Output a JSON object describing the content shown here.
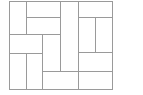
{
  "diagram": {
    "title": "",
    "line_color": "#9a9a9a",
    "background": "#ffffff",
    "frame": {
      "x": 9,
      "y": 1,
      "w": 104,
      "h": 89
    },
    "rects": [
      {
        "id": "r1",
        "x": 9,
        "y": 1,
        "w": 18,
        "h": 34
      },
      {
        "id": "r2",
        "x": 26,
        "y": 1,
        "w": 35,
        "h": 17
      },
      {
        "id": "r3",
        "x": 26,
        "y": 17,
        "w": 35,
        "h": 18
      },
      {
        "id": "r4",
        "x": 60,
        "y": 1,
        "w": 19,
        "h": 71
      },
      {
        "id": "r5",
        "x": 78,
        "y": 1,
        "w": 35,
        "h": 17
      },
      {
        "id": "r6",
        "x": 78,
        "y": 17,
        "w": 18,
        "h": 36
      },
      {
        "id": "r7",
        "x": 95,
        "y": 17,
        "w": 18,
        "h": 36
      },
      {
        "id": "r8",
        "x": 9,
        "y": 34,
        "w": 34,
        "h": 20
      },
      {
        "id": "r9",
        "x": 42,
        "y": 34,
        "w": 19,
        "h": 38
      },
      {
        "id": "r10",
        "x": 78,
        "y": 52,
        "w": 35,
        "h": 20
      },
      {
        "id": "r11",
        "x": 9,
        "y": 53,
        "w": 18,
        "h": 37
      },
      {
        "id": "r12",
        "x": 26,
        "y": 53,
        "w": 17,
        "h": 37
      },
      {
        "id": "r13",
        "x": 42,
        "y": 71,
        "w": 37,
        "h": 19
      },
      {
        "id": "r14",
        "x": 78,
        "y": 71,
        "w": 35,
        "h": 19
      }
    ]
  }
}
